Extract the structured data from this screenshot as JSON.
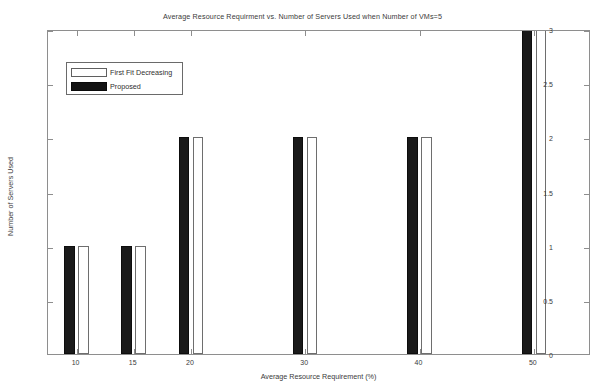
{
  "chart_data": {
    "type": "bar",
    "title": "Average Resource Requirment vs. Number of Servers Used when Number of VMs=5",
    "xlabel": "Average Resource Requirement (%)",
    "ylabel": "Number of Servers Used",
    "categories": [
      "10",
      "15",
      "20",
      "30",
      "40",
      "50"
    ],
    "series": [
      {
        "name": "Proposed",
        "color": "#1a1a1a",
        "values": [
          1,
          1,
          2,
          2,
          2,
          3
        ]
      },
      {
        "name": "First Fit Decreasing",
        "color": "#ffffff",
        "values": [
          1,
          1,
          2,
          2,
          2,
          3
        ]
      }
    ],
    "xlim": [
      7.5,
      55
    ],
    "ylim": [
      0,
      3
    ],
    "xticks": [
      "10",
      "15",
      "20",
      "30",
      "40",
      "50"
    ],
    "xtick_values": [
      10,
      15,
      20,
      30,
      40,
      50
    ],
    "yticks": [
      "0",
      "0.5",
      "1",
      "1.5",
      "2",
      "2.5",
      "3"
    ],
    "ytick_values": [
      0,
      0.5,
      1,
      1.5,
      2,
      2.5,
      3
    ],
    "grid": false,
    "legend_position": "upper-left",
    "legend_entries": [
      "First Fit Decreasing",
      "Proposed"
    ]
  },
  "legend": {
    "entries": [
      {
        "label": "First Fit Decreasing",
        "style": "ffd"
      },
      {
        "label": "Proposed",
        "style": "proposed"
      }
    ]
  }
}
